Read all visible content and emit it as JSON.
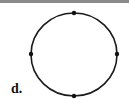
{
  "diagram": {
    "label": "d.",
    "shape": "circle",
    "points": [
      {
        "name": "top",
        "cx": 74,
        "cy": 13
      },
      {
        "name": "left",
        "cx": 31,
        "cy": 54
      },
      {
        "name": "right",
        "cx": 117,
        "cy": 54
      },
      {
        "name": "bottom",
        "cx": 74,
        "cy": 96
      }
    ],
    "circle": {
      "cx": 74,
      "cy": 54.5,
      "rx": 43,
      "ry": 41.5
    },
    "stroke_color": "#1a1a1a"
  }
}
